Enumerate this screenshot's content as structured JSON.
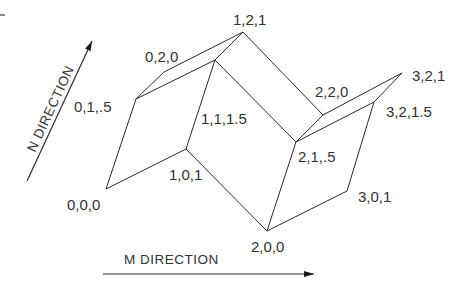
{
  "diagram": {
    "type": "isometric-surface-grid",
    "axes": {
      "n_direction_label": "N DIRECTION",
      "m_direction_label": "M DIRECTION"
    },
    "vertices": [
      {
        "id": "v000",
        "label": "0,0,0"
      },
      {
        "id": "v101",
        "label": "1,0,1"
      },
      {
        "id": "v01h",
        "label": "0,1,.5"
      },
      {
        "id": "v020",
        "label": "0,2,0"
      },
      {
        "id": "v121",
        "label": "1,2,1"
      },
      {
        "id": "v111h",
        "label": "1,1,1.5"
      },
      {
        "id": "v220",
        "label": "2,2,0"
      },
      {
        "id": "v21h",
        "label": "2,1,.5"
      },
      {
        "id": "v200",
        "label": "2,0,0"
      },
      {
        "id": "v301",
        "label": "3,0,1"
      },
      {
        "id": "v321",
        "label": "3,2,1"
      },
      {
        "id": "v321h",
        "label": "3,2,1.5"
      }
    ],
    "edges": [
      [
        "v000",
        "v101"
      ],
      [
        "v000",
        "v01h"
      ],
      [
        "v01h",
        "v020"
      ],
      [
        "v01h",
        "v111h"
      ],
      [
        "v020",
        "v121"
      ],
      [
        "v121",
        "v111h"
      ],
      [
        "v101",
        "v111h"
      ],
      [
        "v101",
        "v200"
      ],
      [
        "v111h",
        "v21h"
      ],
      [
        "v121",
        "v220"
      ],
      [
        "v220",
        "v21h"
      ],
      [
        "v21h",
        "v200"
      ],
      [
        "v220",
        "v321"
      ],
      [
        "v21h",
        "v321h"
      ],
      [
        "v321",
        "v321h"
      ],
      [
        "v321h",
        "v301"
      ],
      [
        "v200",
        "v301"
      ]
    ]
  }
}
